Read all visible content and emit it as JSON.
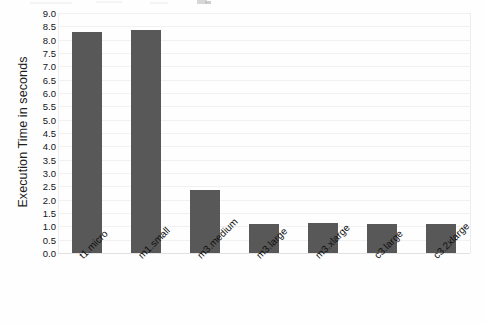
{
  "chart_data": {
    "type": "bar",
    "title": "",
    "subtitle": "",
    "xlabel": "",
    "ylabel": "Execution Time in seconds",
    "categories": [
      "t1.micro",
      "m1.small",
      "m3.medium",
      "m3.large",
      "m3.xlarge",
      "c3.large",
      "c3.2xlarge"
    ],
    "values": [
      8.3,
      8.35,
      2.35,
      1.1,
      1.12,
      1.08,
      1.1
    ],
    "series": [
      {
        "name": "Execution Time",
        "values": [
          8.3,
          8.35,
          2.35,
          1.1,
          1.12,
          1.08,
          1.1
        ]
      }
    ],
    "ylim": [
      0.0,
      9.0
    ],
    "ytick_step": 0.5,
    "ytick_labels": [
      "0.0",
      "0.5",
      "1.0",
      "1.5",
      "2.0",
      "2.5",
      "3.0",
      "3.5",
      "4.0",
      "4.5",
      "5.0",
      "5.5",
      "6.0",
      "6.5",
      "7.0",
      "7.5",
      "8.0",
      "8.5",
      "9.0"
    ],
    "grid": true,
    "grid_axis": "y",
    "legend": false,
    "legend_position": "none",
    "xtick_rotation": -45,
    "bar_color": "#585858",
    "gridline_color": "#f1f1f1",
    "axis_color": "#ededed",
    "background_color": "#fefefe",
    "text_color": "#101010"
  }
}
